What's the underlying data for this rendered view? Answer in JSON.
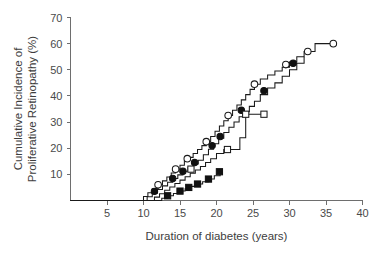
{
  "figure": {
    "title": "",
    "background_color": "#ffffff",
    "axis_color": "#6e6e6e",
    "curve_color": "#1a1a1a"
  },
  "axes": {
    "x_title": "Duration of diabetes (years)",
    "y_title_line1": "Cumulative Incidence of",
    "y_title_line2": "Proliferative Retinopathy (%)",
    "x_ticks": [
      "5",
      "10",
      "15",
      "20",
      "25",
      "30",
      "35",
      "40"
    ],
    "y_ticks": [
      "10",
      "20",
      "30",
      "40",
      "50",
      "60",
      "70"
    ]
  },
  "chart_data": {
    "type": "line",
    "title": "",
    "xlabel": "Duration of diabetes (years)",
    "ylabel": "Cumulative Incidence of Proliferative Retinopathy (%)",
    "xlim": [
      0,
      40
    ],
    "ylim": [
      0,
      70
    ],
    "x_ticks": [
      5,
      10,
      15,
      20,
      25,
      30,
      35,
      40
    ],
    "y_ticks": [
      10,
      20,
      30,
      40,
      50,
      60,
      70
    ],
    "grid": false,
    "legend": "none",
    "step_style": "post",
    "series": [
      {
        "name": "Group A (open circles)",
        "marker": "open-circle",
        "line_color": "#1a1a1a",
        "x": [
          0,
          9.0,
          10.0,
          10.6,
          11.2,
          12.0,
          12.6,
          13.2,
          13.8,
          14.4,
          15.0,
          15.6,
          16.2,
          16.8,
          17.4,
          18.0,
          18.6,
          19.2,
          19.8,
          20.4,
          21.0,
          21.6,
          22.2,
          22.8,
          23.4,
          24.0,
          24.6,
          25.2,
          26.0,
          27.0,
          28.0,
          29.0,
          30.0,
          31.0,
          32.0,
          33.5,
          36.0
        ],
        "y": [
          0,
          0,
          1.5,
          3.0,
          4.5,
          6.0,
          7.5,
          9.0,
          10.5,
          12.0,
          13.5,
          15.0,
          16.5,
          18.0,
          19.5,
          21.0,
          22.5,
          24.5,
          26.5,
          28.5,
          30.5,
          32.5,
          34.5,
          36.5,
          38.5,
          40.5,
          42.5,
          44.5,
          46.5,
          48.0,
          49.5,
          51.0,
          53.0,
          55.0,
          57.0,
          60.0,
          60.0
        ],
        "markers": [
          {
            "x": 12.0,
            "y": 6.0
          },
          {
            "x": 14.4,
            "y": 12.0
          },
          {
            "x": 16.0,
            "y": 16.0
          },
          {
            "x": 18.6,
            "y": 22.5
          },
          {
            "x": 21.6,
            "y": 32.5
          },
          {
            "x": 25.2,
            "y": 44.5
          },
          {
            "x": 29.5,
            "y": 52.0
          },
          {
            "x": 32.5,
            "y": 57.0
          },
          {
            "x": 36.0,
            "y": 60.0
          }
        ]
      },
      {
        "name": "Group B (filled circles)",
        "marker": "filled-circle",
        "line_color": "#1a1a1a",
        "x": [
          0,
          9.5,
          10.5,
          11.2,
          11.9,
          12.6,
          13.3,
          14.0,
          14.7,
          15.4,
          16.1,
          16.8,
          17.5,
          18.2,
          18.9,
          19.6,
          20.3,
          21.0,
          21.7,
          22.4,
          23.1,
          23.8,
          24.5,
          25.2,
          26.0,
          27.0,
          28.0,
          29.0,
          30.0,
          31.0,
          32.0
        ],
        "y": [
          0,
          0,
          1.4,
          2.8,
          4.2,
          5.6,
          7.0,
          8.4,
          9.8,
          11.2,
          12.6,
          14.0,
          15.4,
          17.5,
          19.6,
          21.7,
          23.8,
          26.0,
          28.0,
          30.0,
          32.0,
          34.0,
          36.0,
          38.0,
          40.5,
          43.0,
          45.0,
          47.5,
          50.0,
          52.5,
          55.0
        ],
        "markers": [
          {
            "x": 11.5,
            "y": 3.5
          },
          {
            "x": 14.0,
            "y": 8.4
          },
          {
            "x": 15.4,
            "y": 11.2
          },
          {
            "x": 17.0,
            "y": 14.5
          },
          {
            "x": 19.4,
            "y": 21.0
          },
          {
            "x": 20.5,
            "y": 24.5
          },
          {
            "x": 23.4,
            "y": 34.5
          },
          {
            "x": 26.5,
            "y": 42.0
          },
          {
            "x": 30.5,
            "y": 52.5
          }
        ]
      },
      {
        "name": "Group C (open squares)",
        "marker": "open-square",
        "line_color": "#1a1a1a",
        "x": [
          0,
          10.5,
          11.5,
          12.2,
          12.9,
          13.6,
          14.3,
          15.0,
          15.7,
          16.4,
          17.1,
          17.8,
          18.5,
          19.2,
          20.0,
          21.0,
          22.0,
          23.2,
          24.0,
          26.5
        ],
        "y": [
          0,
          0,
          1.3,
          2.6,
          3.9,
          5.2,
          6.5,
          7.8,
          9.1,
          10.4,
          11.7,
          13.0,
          14.5,
          16.0,
          18.0,
          19.5,
          19.5,
          24.0,
          33.0,
          33.0
        ],
        "markers": [
          {
            "x": 16.5,
            "y": 12.0
          },
          {
            "x": 21.5,
            "y": 19.5
          },
          {
            "x": 24.0,
            "y": 33.0
          },
          {
            "x": 26.5,
            "y": 33.0
          }
        ]
      },
      {
        "name": "Group D (filled squares)",
        "marker": "filled-square",
        "line_color": "#1a1a1a",
        "x": [
          0,
          11.5,
          12.5,
          13.3,
          14.1,
          14.9,
          15.7,
          16.5,
          17.3,
          18.1,
          18.9,
          19.7,
          20.5
        ],
        "y": [
          0,
          0,
          0.9,
          1.8,
          2.7,
          3.6,
          4.5,
          5.4,
          6.3,
          7.2,
          8.2,
          9.5,
          11.0
        ],
        "markers": [
          {
            "x": 13.3,
            "y": 1.8
          },
          {
            "x": 15.0,
            "y": 3.6
          },
          {
            "x": 16.2,
            "y": 5.0
          },
          {
            "x": 17.4,
            "y": 6.3
          },
          {
            "x": 18.9,
            "y": 8.2
          },
          {
            "x": 20.4,
            "y": 11.0
          }
        ]
      }
    ]
  }
}
